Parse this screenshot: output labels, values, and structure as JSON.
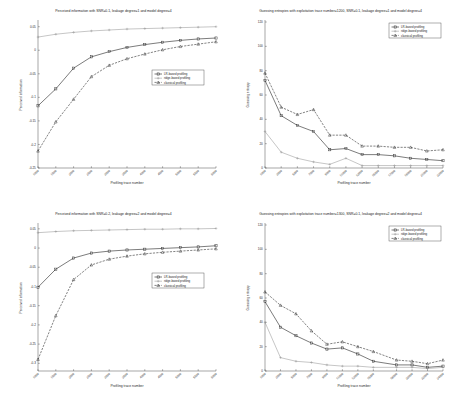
{
  "figure": {
    "background": "#ffffff",
    "panel_count": 4
  },
  "legend": {
    "entries": [
      {
        "label": "LR-based profiling",
        "marker": "square",
        "style": "solid",
        "color": "#2a2a2a"
      },
      {
        "label": "ridge-based profiling",
        "marker": "plus",
        "style": "solid",
        "color": "#8d8d8d"
      },
      {
        "label": "classical profiling",
        "marker": "triangle",
        "style": "dashed",
        "color": "#2a2a2a"
      }
    ]
  },
  "chart_data": [
    {
      "type": "line",
      "panel": "top-left",
      "title": "Perceived information with SNR=0.1, leakage degree=1 and model degree=4",
      "xlabel": "Profiling trace number",
      "ylabel": "Perceived information",
      "xlim": [
        1000,
        6000
      ],
      "ylim": [
        -0.25,
        0.06
      ],
      "xticks": [
        1000,
        1500,
        2000,
        2500,
        3000,
        3500,
        4000,
        4500,
        5000,
        5500,
        6000
      ],
      "yticks": [
        -0.25,
        -0.2,
        -0.15,
        -0.1,
        -0.05,
        0,
        0.05
      ],
      "ytick_labels": [
        "-0.25",
        "-0.2",
        "-0.15",
        "-0.1",
        "-0.05",
        "0",
        "0.05"
      ],
      "grid": false,
      "legend_position": "center-right",
      "x": [
        1000,
        1500,
        2000,
        2500,
        3000,
        3500,
        4000,
        4500,
        5000,
        5500,
        6000
      ],
      "series": [
        {
          "name": "ridge-based profiling",
          "values": [
            0.028,
            0.034,
            0.038,
            0.041,
            0.043,
            0.045,
            0.046,
            0.047,
            0.048,
            0.049,
            0.05
          ]
        },
        {
          "name": "LR-based profiling",
          "values": [
            -0.118,
            -0.082,
            -0.038,
            -0.014,
            -0.003,
            0.006,
            0.012,
            0.017,
            0.021,
            0.024,
            0.026
          ]
        },
        {
          "name": "classical profiling",
          "values": [
            -0.214,
            -0.152,
            -0.104,
            -0.056,
            -0.032,
            -0.018,
            -0.008,
            0.001,
            0.008,
            0.013,
            0.018
          ]
        }
      ]
    },
    {
      "type": "line",
      "panel": "top-right",
      "title": "Guessing entropies with exploitation trace number=1200, SNR=0.1, leakage degree=1 and model degree=4",
      "xlabel": "Profiling trace number",
      "ylabel": "Guessing entropy",
      "xlim": [
        1000,
        23000
      ],
      "ylim": [
        0,
        120
      ],
      "xticks": [
        1000,
        3000,
        5000,
        7000,
        9000,
        11000,
        13000,
        15000,
        17000,
        19000,
        21000,
        23000
      ],
      "yticks": [
        0,
        20,
        40,
        60,
        80,
        100,
        120
      ],
      "ytick_labels": [
        "0",
        "20",
        "40",
        "60",
        "80",
        "100",
        "120"
      ],
      "grid": false,
      "legend_position": "top-right",
      "x": [
        1000,
        3000,
        5000,
        7000,
        9000,
        11000,
        13000,
        15000,
        17000,
        19000,
        21000,
        23000
      ],
      "series": [
        {
          "name": "classical profiling",
          "values": [
            78,
            50,
            44,
            48,
            27,
            27,
            18,
            18,
            17,
            17,
            14,
            15
          ]
        },
        {
          "name": "LR-based profiling",
          "values": [
            72,
            43,
            35,
            30,
            15,
            16,
            11,
            11,
            10,
            8,
            7,
            6
          ]
        },
        {
          "name": "ridge-based profiling",
          "values": [
            30,
            13,
            8,
            5,
            3,
            8,
            2,
            2,
            2,
            2,
            2,
            2
          ]
        }
      ]
    },
    {
      "type": "line",
      "panel": "bottom-left",
      "title": "Perceived information with SNR=0.2, leakage degree=2 and model degree=4",
      "xlabel": "Profiling trace number",
      "ylabel": "Perceived information",
      "xlim": [
        1000,
        6000
      ],
      "ylim": [
        -0.32,
        0.06
      ],
      "xticks": [
        1000,
        1500,
        2000,
        2500,
        3000,
        3500,
        4000,
        4500,
        5000,
        5500,
        6000
      ],
      "yticks": [
        -0.3,
        -0.25,
        -0.2,
        -0.15,
        -0.1,
        -0.05,
        0,
        0.05
      ],
      "ytick_labels": [
        "-0.3",
        "-0.25",
        "-0.2",
        "-0.15",
        "-0.1",
        "-0.05",
        "0",
        "0.05"
      ],
      "grid": false,
      "legend_position": "center-right",
      "x": [
        1000,
        1500,
        2000,
        2500,
        3000,
        3500,
        4000,
        4500,
        5000,
        5500,
        6000
      ],
      "series": [
        {
          "name": "ridge-based profiling",
          "values": [
            0.04,
            0.043,
            0.045,
            0.046,
            0.047,
            0.048,
            0.049,
            0.049,
            0.05,
            0.05,
            0.051
          ]
        },
        {
          "name": "LR-based profiling",
          "values": [
            -0.102,
            -0.055,
            -0.026,
            -0.013,
            -0.008,
            -0.005,
            -0.003,
            -0.001,
            0.001,
            0.003,
            0.006
          ]
        },
        {
          "name": "classical profiling",
          "values": [
            -0.29,
            -0.176,
            -0.082,
            -0.044,
            -0.029,
            -0.021,
            -0.015,
            -0.011,
            -0.008,
            -0.005,
            -0.002
          ]
        }
      ]
    },
    {
      "type": "line",
      "panel": "bottom-right",
      "title": "Guessing entropies with exploitation trace number=1300, SNR=0.1, leakage degree=2 and model degree=4",
      "xlabel": "Profiling trace number",
      "ylabel": "Guessing entropy",
      "xlim": [
        1000,
        24000
      ],
      "ylim": [
        0,
        120
      ],
      "xticks": [
        1000,
        3000,
        5000,
        7000,
        9000,
        11000,
        13000,
        15000,
        18000,
        20000,
        22000,
        24000
      ],
      "yticks": [
        0,
        20,
        40,
        60,
        80,
        100,
        120
      ],
      "ytick_labels": [
        "0",
        "20",
        "40",
        "60",
        "80",
        "100",
        "120"
      ],
      "grid": false,
      "legend_position": "top-right",
      "x": [
        1000,
        3000,
        5000,
        7000,
        9000,
        11000,
        13000,
        15000,
        18000,
        20000,
        22000,
        24000
      ],
      "series": [
        {
          "name": "classical profiling",
          "values": [
            65,
            54,
            47,
            33,
            22,
            24,
            20,
            16,
            9,
            8,
            6,
            9
          ]
        },
        {
          "name": "LR-based profiling",
          "values": [
            57,
            36,
            29,
            23,
            18,
            19,
            14,
            8,
            5,
            5,
            3,
            4
          ]
        },
        {
          "name": "ridge-based profiling",
          "values": [
            40,
            11,
            8,
            7,
            5,
            4,
            4,
            3,
            3,
            3,
            2,
            3
          ]
        }
      ]
    }
  ]
}
